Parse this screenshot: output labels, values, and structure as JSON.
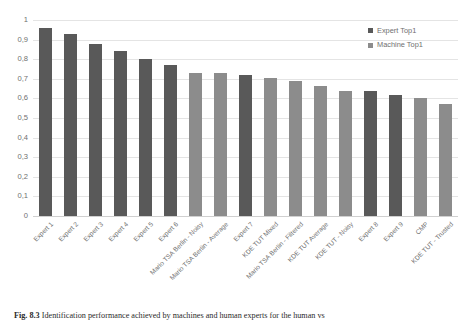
{
  "chart_data": {
    "type": "bar",
    "title": "",
    "xlabel": "",
    "ylabel": "",
    "ylim": [
      0,
      1
    ],
    "yticks": [
      "0",
      "0,1",
      "0,2",
      "0,3",
      "0,4",
      "0,5",
      "0,6",
      "0,7",
      "0,8",
      "0,9",
      "1"
    ],
    "ytick_values": [
      0,
      0.1,
      0.2,
      0.3,
      0.4,
      0.5,
      0.6,
      0.7,
      0.8,
      0.9,
      1
    ],
    "grid": true,
    "legend_position": "top-right",
    "categories": [
      "Expert 1",
      "Expert 2",
      "Expert 3",
      "Expert 4",
      "Expert 5",
      "Expert 6",
      "Mario TSA Berlin - Noisy",
      "Mario TSA Berlin - Average",
      "Expert 7",
      "KDE TUT Mixed",
      "Mario TSA Berlin - Filtered",
      "KDE TUT Average",
      "KDE TUT - Noisy",
      "Expert 8",
      "Expert 9",
      "CMP",
      "KDE TUT - Trusted"
    ],
    "values": [
      0.96,
      0.93,
      0.88,
      0.84,
      0.8,
      0.77,
      0.73,
      0.73,
      0.72,
      0.705,
      0.69,
      0.665,
      0.64,
      0.64,
      0.615,
      0.6,
      0.57
    ],
    "series_of_bar": [
      "Expert Top1",
      "Expert Top1",
      "Expert Top1",
      "Expert Top1",
      "Expert Top1",
      "Expert Top1",
      "Machine Top1",
      "Machine Top1",
      "Expert Top1",
      "Machine Top1",
      "Machine Top1",
      "Machine Top1",
      "Machine Top1",
      "Expert Top1",
      "Expert Top1",
      "Machine Top1",
      "Machine Top1"
    ],
    "series": [
      {
        "name": "Expert Top1",
        "color": "#595959",
        "values": [
          0.96,
          0.93,
          0.88,
          0.84,
          0.8,
          0.77,
          null,
          null,
          0.72,
          null,
          null,
          null,
          null,
          0.64,
          0.615,
          null,
          null
        ]
      },
      {
        "name": "Machine Top1",
        "color": "#8c8c8c",
        "values": [
          null,
          null,
          null,
          null,
          null,
          null,
          0.73,
          0.73,
          null,
          0.705,
          0.69,
          0.665,
          0.64,
          null,
          null,
          0.6,
          0.57
        ]
      }
    ]
  },
  "legend": {
    "items": [
      {
        "label": "Expert Top1",
        "color": "#595959"
      },
      {
        "label": "Machine Top1",
        "color": "#8c8c8c"
      }
    ]
  },
  "caption": {
    "number": "Fig. 8.3",
    "text": "Identification performance achieved by machines and human experts for the human vs"
  }
}
